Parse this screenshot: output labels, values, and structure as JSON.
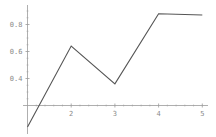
{
  "chart_data": {
    "type": "line",
    "title": "",
    "xlabel": "",
    "ylabel": "",
    "x": [
      1,
      2,
      3,
      4,
      5
    ],
    "series": [
      {
        "name": "data",
        "values": [
          0.04,
          0.64,
          0.36,
          0.88,
          0.87
        ]
      }
    ],
    "x_ticks": [
      "2",
      "3",
      "4",
      "5"
    ],
    "y_ticks": [
      "0.4",
      "0.6",
      "0.8"
    ],
    "x_tick_values": [
      2,
      3,
      4,
      5
    ],
    "y_tick_values": [
      0.4,
      0.6,
      0.8
    ],
    "xlim": [
      1,
      5.1
    ],
    "ylim": [
      0.04,
      0.92
    ],
    "axes_origin": [
      1,
      0.2
    ],
    "grid": false,
    "legend": "none",
    "colors": {
      "line": "#555555",
      "axis": "#9a9a9a",
      "tick_label": "#8a8a8a"
    }
  }
}
